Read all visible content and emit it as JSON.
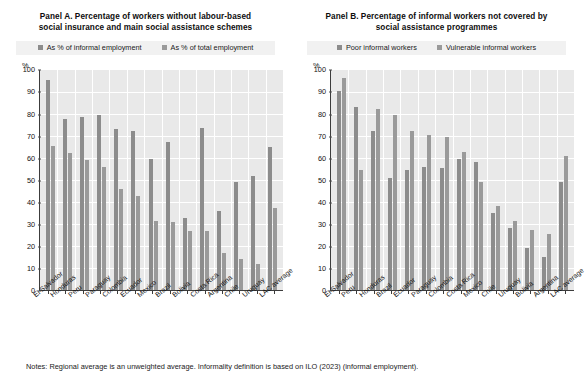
{
  "notes": "Notes: Regional average is an unweighted average. Informality definition is based on ILO (2023) (informal employment).",
  "colors": {
    "series_a1": "#8c8c8c",
    "series_a2": "#9a9a9a",
    "plot_background": "#e9e9e9",
    "gridline": "#ffffff",
    "axis": "#3c3c3c",
    "legend_background": "#f1f1f1"
  },
  "chart_data": [
    {
      "type": "bar",
      "panel": "Panel A",
      "title": "Panel A. Percentage of workers without labour-based social insurance and main social assistance schemes",
      "xlabel": "",
      "ylabel": "%",
      "ylim": [
        0,
        100
      ],
      "yticks": [
        0,
        10,
        20,
        30,
        40,
        50,
        60,
        70,
        80,
        90,
        100
      ],
      "grid": true,
      "legend_position": "top",
      "categories": [
        "El Salvador",
        "Honduras",
        "Peru",
        "Paraguay",
        "Colombia",
        "Ecuador",
        "Mexico",
        "Brazil",
        "Bolivia",
        "Costa Rica",
        "Argentina",
        "Chile",
        "Uruguay",
        "LAC average"
      ],
      "series": [
        {
          "name": "As % of informal employment",
          "values": [
            95.5,
            78.0,
            79.0,
            79.5,
            73.5,
            72.5,
            59.5,
            67.5,
            33.0,
            74.0,
            36.0,
            49.0,
            52.0,
            65.0
          ]
        },
        {
          "name": "As % of total employment",
          "values": [
            65.5,
            62.5,
            59.0,
            56.0,
            46.0,
            43.0,
            31.5,
            31.0,
            27.0,
            27.0,
            17.0,
            14.0,
            12.0,
            37.5
          ]
        }
      ]
    },
    {
      "type": "bar",
      "panel": "Panel B",
      "title": "Panel B. Percentage of informal workers not covered by social assistance programmes",
      "xlabel": "",
      "ylabel": "%",
      "ylim": [
        0,
        100
      ],
      "yticks": [
        0,
        10,
        20,
        30,
        40,
        50,
        60,
        70,
        80,
        90,
        100
      ],
      "grid": true,
      "legend_position": "top",
      "categories": [
        "El Salvador",
        "Peru",
        "Honduras",
        "Brazil",
        "Ecuador",
        "Paraguay",
        "Colombia",
        "Costa Rica",
        "Mexico",
        "Chile",
        "Uruguay",
        "Bolivia",
        "Argentina",
        "LAC average"
      ],
      "series": [
        {
          "name": "Poor informal workers",
          "values": [
            90.5,
            83.5,
            72.5,
            51.0,
            54.5,
            56.0,
            55.5,
            59.5,
            58.5,
            35.0,
            28.5,
            19.0,
            15.0,
            49.0
          ]
        },
        {
          "name": "Vulnerable informal workers",
          "values": [
            96.5,
            54.5,
            82.5,
            79.5,
            72.5,
            70.5,
            69.5,
            63.0,
            49.0,
            38.5,
            31.5,
            27.5,
            25.5,
            61.0
          ]
        }
      ]
    }
  ],
  "panels": [
    {
      "title_line1": "Panel A. Percentage of workers without labour-based",
      "title_line2": "social insurance and main social assistance schemes",
      "legend": [
        {
          "label": "As % of informal employment",
          "color": "#8c8c8c"
        },
        {
          "label": "As % of total employment",
          "color": "#9a9a9a"
        }
      ],
      "axis_unit": "%"
    },
    {
      "title_line1": "Panel B. Percentage of informal workers not covered by",
      "title_line2": "social assistance programmes",
      "legend": [
        {
          "label": "Poor informal workers",
          "color": "#8c8c8c"
        },
        {
          "label": "Vulnerable informal workers",
          "color": "#9a9a9a"
        }
      ],
      "axis_unit": "%"
    }
  ]
}
